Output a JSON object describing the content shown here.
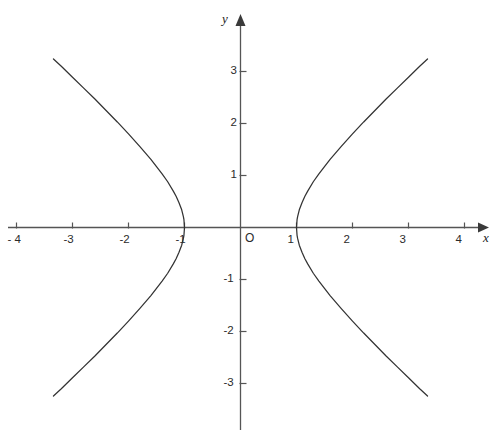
{
  "figure": {
    "background_color": "#ffffff",
    "axis_color": "#555555",
    "curve_color": "#333333",
    "text_color": "#2b2b2b",
    "origin_label": "O",
    "x_axis_name": "x",
    "y_axis_name": "y"
  },
  "chart_data": {
    "type": "line",
    "title": "",
    "xlabel": "x",
    "ylabel": "y",
    "xlim": [
      -4.2,
      4.4
    ],
    "ylim": [
      -4.1,
      4.1
    ],
    "grid": false,
    "legend": null,
    "x_ticks": [
      -4,
      -3,
      -2,
      -1,
      1,
      2,
      3,
      4
    ],
    "x_tick_labels": [
      "- 4",
      "-3",
      "-2",
      "-1",
      "1",
      "2",
      "3",
      "4"
    ],
    "y_ticks": [
      -3,
      -2,
      -1,
      1,
      2,
      3
    ],
    "y_tick_labels": [
      "-3",
      "-2",
      "-1",
      "1",
      "2",
      "3"
    ],
    "origin_label": "O",
    "curve_equation": "x^2 - y^2/1.1 = 1",
    "series": [
      {
        "name": "right-branch",
        "points": [
          [
            1.0,
            0.0
          ],
          [
            1.01,
            0.15
          ],
          [
            1.02,
            0.21
          ],
          [
            1.05,
            0.34
          ],
          [
            1.1,
            0.48
          ],
          [
            1.15,
            0.6
          ],
          [
            1.2,
            0.7
          ],
          [
            1.3,
            0.88
          ],
          [
            1.4,
            1.03
          ],
          [
            1.5,
            1.17
          ],
          [
            1.6,
            1.31
          ],
          [
            1.8,
            1.56
          ],
          [
            2.0,
            1.8
          ],
          [
            2.2,
            2.03
          ],
          [
            2.4,
            2.25
          ],
          [
            2.6,
            2.47
          ],
          [
            2.8,
            2.68
          ],
          [
            3.0,
            2.89
          ],
          [
            3.2,
            3.1
          ],
          [
            3.34,
            3.24
          ]
        ]
      },
      {
        "name": "left-branch",
        "points": [
          [
            -1.0,
            0.0
          ],
          [
            -1.01,
            0.15
          ],
          [
            -1.02,
            0.21
          ],
          [
            -1.05,
            0.34
          ],
          [
            -1.1,
            0.48
          ],
          [
            -1.15,
            0.6
          ],
          [
            -1.2,
            0.7
          ],
          [
            -1.3,
            0.88
          ],
          [
            -1.4,
            1.03
          ],
          [
            -1.5,
            1.17
          ],
          [
            -1.6,
            1.31
          ],
          [
            -1.8,
            1.56
          ],
          [
            -2.0,
            1.8
          ],
          [
            -2.2,
            2.03
          ],
          [
            -2.4,
            2.25
          ],
          [
            -2.6,
            2.47
          ],
          [
            -2.8,
            2.68
          ],
          [
            -3.0,
            2.89
          ],
          [
            -3.2,
            3.1
          ],
          [
            -3.34,
            3.24
          ]
        ]
      }
    ]
  }
}
